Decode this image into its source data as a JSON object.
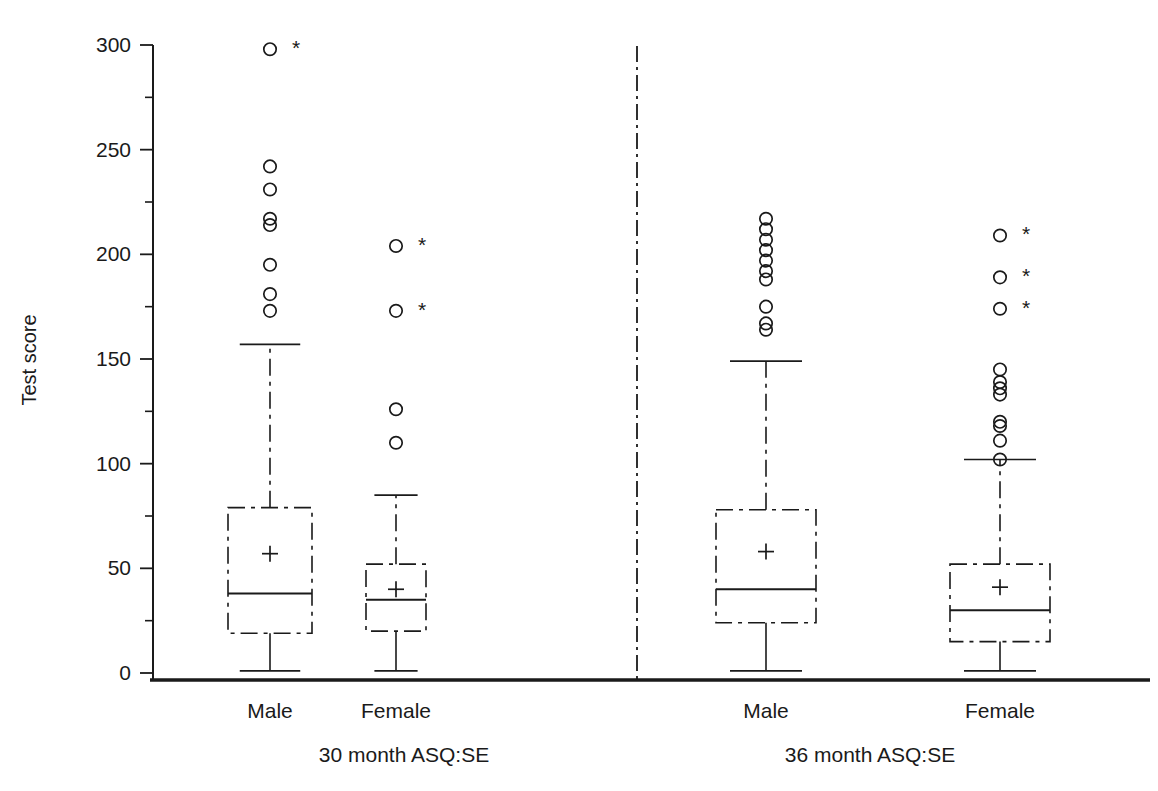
{
  "chart_data": {
    "type": "box",
    "title": "",
    "xlabel": "",
    "ylabel": "Test score",
    "ylim": [
      0,
      300
    ],
    "yticks_major": [
      0,
      50,
      100,
      150,
      200,
      250,
      300
    ],
    "yticks_minor": [
      25,
      75,
      125,
      175,
      225,
      275
    ],
    "grid": false,
    "legend": "none",
    "panels": [
      {
        "name": "30 month ASQ:SE",
        "groups": [
          {
            "label": "Male",
            "min": 1,
            "q1": 19,
            "median": 38,
            "q3": 79,
            "max": 157,
            "mean": 57,
            "outliers": [
              298,
              242,
              231,
              217,
              214,
              195,
              181,
              173
            ],
            "extreme_outliers": [
              299
            ]
          },
          {
            "label": "Female",
            "min": 1,
            "q1": 20,
            "median": 35,
            "q3": 52,
            "max": 85,
            "mean": 40,
            "outliers": [
              204,
              173,
              126,
              110
            ],
            "extreme_outliers": [
              205,
              174
            ]
          }
        ]
      },
      {
        "name": "36 month ASQ:SE",
        "groups": [
          {
            "label": "Male",
            "min": 1,
            "q1": 24,
            "median": 40,
            "q3": 78,
            "max": 149,
            "mean": 58,
            "outliers": [
              217,
              212,
              207,
              202,
              197,
              192,
              188,
              175,
              167,
              164
            ],
            "extreme_outliers": []
          },
          {
            "label": "Female",
            "min": 1,
            "q1": 15,
            "median": 30,
            "q3": 52,
            "max": 102,
            "mean": 41,
            "outliers": [
              209,
              189,
              174,
              145,
              139,
              136,
              133,
              120,
              118,
              111,
              102
            ],
            "extreme_outliers": [
              210,
              190,
              175
            ]
          }
        ]
      }
    ],
    "markers": {
      "mean_symbol": "+",
      "outlier_symbol": "o",
      "extreme_symbol": "*"
    },
    "style": {
      "line_color": "#1a1a1a",
      "box_border": "dashed",
      "median_line": "solid",
      "panel_divider": "dash-dot",
      "background": "#ffffff"
    }
  },
  "axis": {
    "y_title": "Test score",
    "y_tick_labels": [
      "300",
      "250",
      "200",
      "150",
      "100",
      "50",
      "0"
    ]
  }
}
